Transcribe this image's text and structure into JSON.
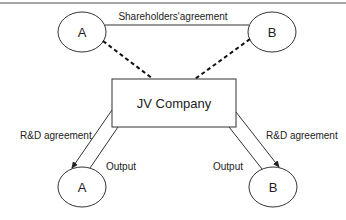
{
  "diagram": {
    "title_rule_color": "#8a8a8a",
    "top": {
      "party_a": "A",
      "party_b": "B",
      "link_label": "Shareholders'agreement"
    },
    "center": {
      "label": "JV Company"
    },
    "bottom": {
      "party_a": "A",
      "party_b": "B",
      "left_arrow_label": "R&D agreement",
      "left_return_label": "Output",
      "right_arrow_label": "R&D agreement",
      "right_return_label": "Output"
    }
  }
}
